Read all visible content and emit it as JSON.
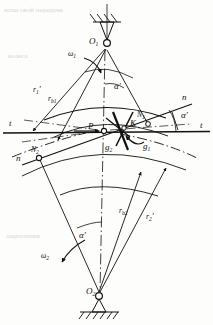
{
  "figure": {
    "background_color": "#fdfdfb",
    "ink_color": "#111111",
    "ghost_text_color": "#cfcabc"
  },
  "labels": {
    "center_top": "O",
    "center_top_sub": "1",
    "center_bottom": "O",
    "center_bottom_sub": "2",
    "omega_top": "ω",
    "omega_top_sub": "1",
    "omega_bottom": "ω",
    "omega_bottom_sub": "2",
    "radius_top_pitch": "r",
    "radius_top_pitch_sub": "1",
    "radius_top_pitch_prime": "′",
    "radius_top_base": "r",
    "radius_top_base_sub": "b1",
    "radius_bottom_base": "r",
    "radius_bottom_base_sub": "b2",
    "radius_bottom_pitch": "r",
    "radius_bottom_pitch_sub": "2",
    "radius_bottom_pitch_prime": "′",
    "point_n1": "N",
    "point_n1_sub": "1",
    "point_n2": "N",
    "point_n2_sub": "2",
    "pitch_point": "P",
    "contact_point": "K",
    "g_one": "g",
    "g_one_sub": "1",
    "g_two": "g",
    "g_two_sub": "2",
    "normal_right": "n",
    "normal_left": "n",
    "tangent_left": "t",
    "tangent_right": "t",
    "alpha_top": "α",
    "alpha_top_prime": "′",
    "alpha_right": "α",
    "alpha_right_prime": "′",
    "alpha_bottom": "α",
    "alpha_bottom_prime": "′"
  },
  "geometry": {
    "center_top": {
      "x": 107,
      "y": 46
    },
    "center_bottom": {
      "x": 99,
      "y": 296
    },
    "pitch_point": {
      "x": 104,
      "y": 131
    },
    "contact_point": {
      "x": 124,
      "y": 128
    },
    "point_n1": {
      "x": 148,
      "y": 124
    },
    "point_n2": {
      "x": 39,
      "y": 158
    },
    "tangent_line_y": 132,
    "pressure_angle_deg": 20
  },
  "ghost_text": {
    "row1": "назы  овой  передачи",
    "row2": "колеса",
    "row3": "зацепления"
  }
}
